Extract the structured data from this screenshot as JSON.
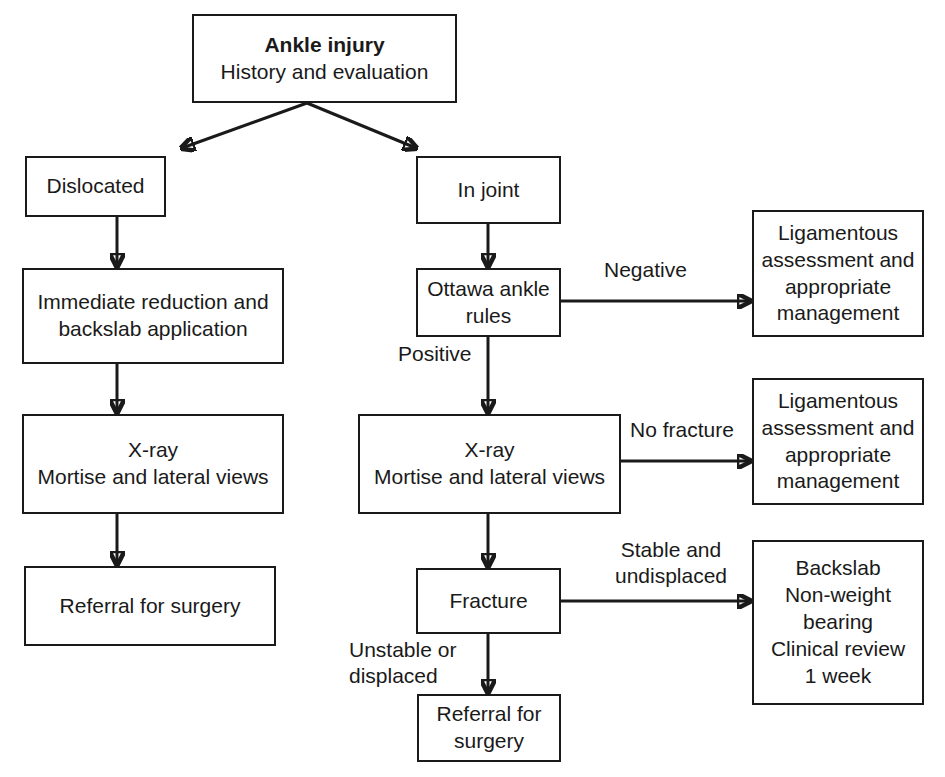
{
  "diagram": {
    "colors": {
      "stroke": "#1a1a1a",
      "background": "#ffffff"
    },
    "nodes": {
      "root": {
        "line1": "Ankle injury",
        "line2": "History and evaluation"
      },
      "dislocated": {
        "line1": "Dislocated"
      },
      "in_joint": {
        "line1": "In joint"
      },
      "reduction": {
        "line1": "Immediate reduction and",
        "line2": "backslab application"
      },
      "ottawa": {
        "line1": "Ottawa ankle",
        "line2": "rules"
      },
      "ligament_1": {
        "line1": "Ligamentous",
        "line2": "assessment and",
        "line3": "appropriate",
        "line4": "management"
      },
      "xray_left": {
        "line1": "X-ray",
        "line2": "Mortise and lateral views"
      },
      "xray_mid": {
        "line1": "X-ray",
        "line2": "Mortise and lateral views"
      },
      "ligament_2": {
        "line1": "Ligamentous",
        "line2": "assessment and",
        "line3": "appropriate",
        "line4": "management"
      },
      "referral_left": {
        "line1": "Referral for surgery"
      },
      "fracture": {
        "line1": "Fracture"
      },
      "backslab": {
        "line1": "Backslab",
        "line2": "Non-weight",
        "line3": "bearing",
        "line4": "Clinical review",
        "line5": "1 week"
      },
      "referral_mid": {
        "line1": "Referral for",
        "line2": "surgery"
      }
    },
    "edge_labels": {
      "negative": "Negative",
      "positive": "Positive",
      "no_fracture": "No fracture",
      "stable_line1": "Stable and",
      "stable_line2": "undisplaced",
      "unstable_line1": "Unstable or",
      "unstable_line2": "displaced"
    }
  }
}
